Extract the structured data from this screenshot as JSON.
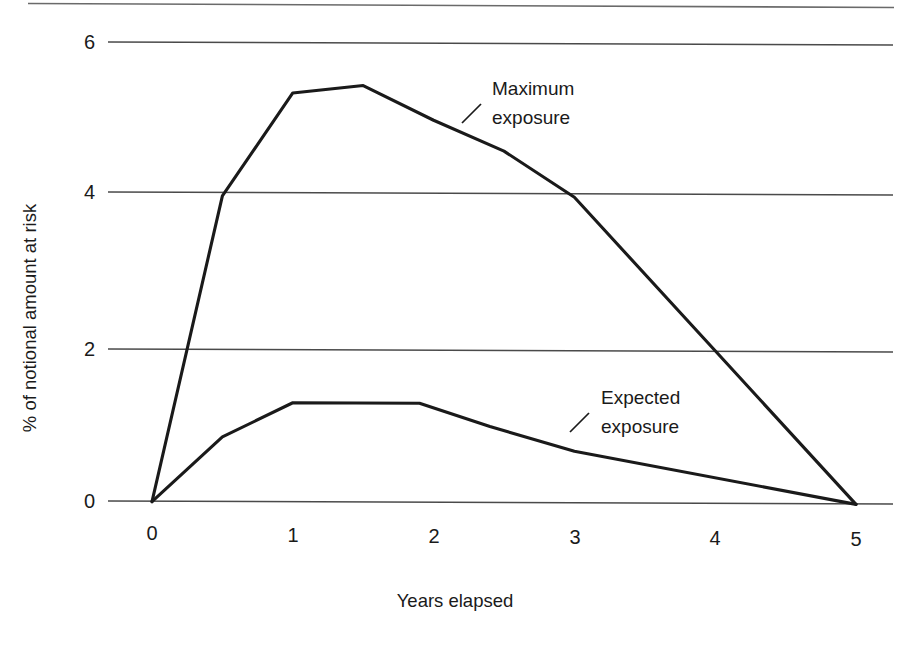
{
  "chart_data": {
    "type": "line",
    "title": "",
    "subtitle": "",
    "xlabel": "Years elapsed",
    "ylabel": "% of notional amount at risk",
    "xlim": [
      0,
      5
    ],
    "ylim": [
      0,
      6.6
    ],
    "grid": true,
    "grid_axis": "y",
    "legend_position": "inline-annotations",
    "x_ticks": [
      "0",
      "1",
      "2",
      "3",
      "4",
      "5"
    ],
    "x_tick_values": [
      0,
      1,
      2,
      3,
      4,
      5
    ],
    "y_ticks": [
      "0",
      "2",
      "4",
      "6"
    ],
    "y_tick_values": [
      0,
      2,
      4,
      6
    ],
    "series": [
      {
        "name": "Maximum exposure",
        "color": "#1a1a1a",
        "x": [
          0,
          0.5,
          1.0,
          1.5,
          2.0,
          2.5,
          3.0,
          4.0,
          5.0
        ],
        "values": [
          0,
          4.0,
          5.35,
          5.45,
          5.0,
          4.6,
          4.0,
          2.0,
          0
        ]
      },
      {
        "name": "Expected exposure",
        "color": "#1a1a1a",
        "x": [
          0,
          0.5,
          1.0,
          1.9,
          2.4,
          3.0,
          5.0
        ],
        "values": [
          0,
          0.85,
          1.3,
          1.3,
          1.0,
          0.68,
          0
        ]
      }
    ],
    "annotations": [
      {
        "text_line1": "Maximum",
        "text_line2": "exposure",
        "leader": true,
        "target_x": 2.3,
        "target_y": 4.9
      },
      {
        "text_line1": "Expected",
        "text_line2": "exposure",
        "leader": true,
        "target_x": 3.1,
        "target_y": 0.65
      }
    ]
  },
  "axes": {
    "x_title": "Years elapsed",
    "y_title": "% of notional amount at risk",
    "x_tick_labels": [
      "0",
      "1",
      "2",
      "3",
      "4",
      "5"
    ],
    "y_tick_labels": [
      "0",
      "2",
      "4",
      "6"
    ]
  },
  "annotations": {
    "maximum": {
      "line1": "Maximum",
      "line2": "exposure"
    },
    "expected": {
      "line1": "Expected",
      "line2": "exposure"
    }
  },
  "colors": {
    "line": "#1a1a1a",
    "grid": "#4a4a4a",
    "background": "#ffffff",
    "border": "#6a6a6a"
  }
}
